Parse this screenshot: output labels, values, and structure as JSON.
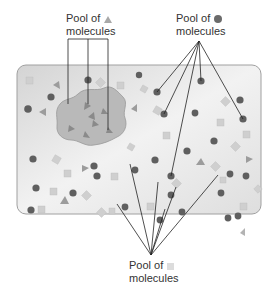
{
  "labels": {
    "triangle_pool": {
      "line1": "Pool of",
      "line2": "molecules",
      "symbol": "triangle"
    },
    "circle_pool": {
      "line1": "Pool of",
      "line2": "molecules",
      "symbol": "circle"
    },
    "square_pool": {
      "line1": "Pool of",
      "line2": "molecules",
      "symbol": "square"
    }
  },
  "colors": {
    "cell_fill": "#e6e6e6",
    "cell_stroke": "#9a9a9a",
    "compartment_fill": "#b5b5b5",
    "compartment_stroke": "#8c8c8c",
    "circle": "#666666",
    "triangle": "#8f8f8f",
    "square": "#d2d2d2",
    "leader_line": "#222222"
  }
}
